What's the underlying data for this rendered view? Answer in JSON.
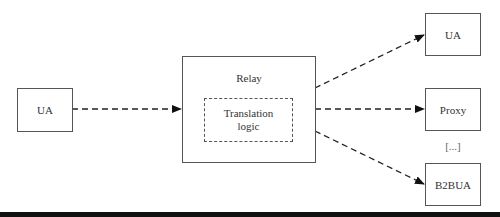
{
  "diagram": {
    "nodes": {
      "source_ua": {
        "label": "UA"
      },
      "relay": {
        "label": "Relay"
      },
      "translation": {
        "line1": "Translation",
        "line2": "logic"
      },
      "target_ua": {
        "label": "UA"
      },
      "proxy": {
        "label": "Proxy"
      },
      "ellipsis": {
        "label": "[...]"
      },
      "b2bua": {
        "label": "B2BUA"
      }
    },
    "edges": [
      {
        "from": "UA",
        "to": "Relay",
        "style": "dashed"
      },
      {
        "from": "Relay",
        "to": "UA",
        "style": "dashed"
      },
      {
        "from": "Relay",
        "to": "Proxy",
        "style": "dashed"
      },
      {
        "from": "Relay",
        "to": "B2BUA",
        "style": "dashed"
      }
    ],
    "colors": {
      "stroke": "#555555",
      "text": "#333333",
      "bar": "#111111"
    }
  }
}
